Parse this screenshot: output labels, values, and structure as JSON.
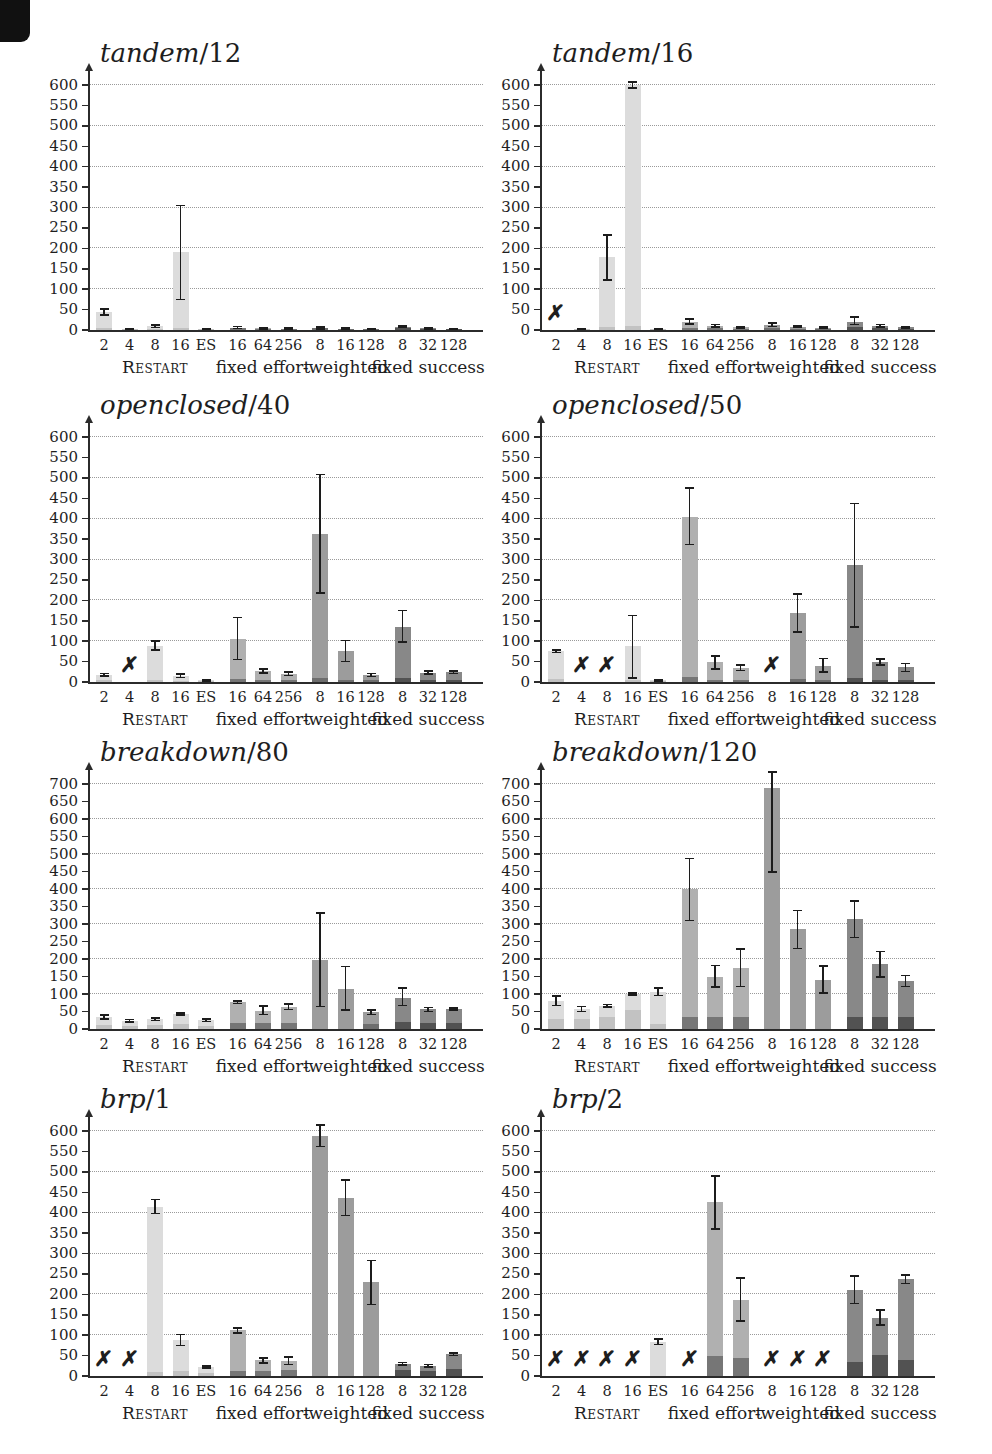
{
  "page": {
    "background": "#ffffff",
    "scan_artifact": "black-corner-mark"
  },
  "colors": {
    "restart_top": "#dcdcdc",
    "restart_base": "#c2c2c2",
    "fixed_effort_top": "#b0b0b0",
    "fixed_effort_base": "#767676",
    "weighted_top": "#9c9c9c",
    "weighted_base": "#6e6e6e",
    "fixed_success_top": "#888888",
    "fixed_success_base": "#525252",
    "error_bar": "#1c1c1c",
    "axis": "#2b2b2b",
    "grid": "#9a9a9a",
    "text": "#1e1e1e",
    "scan_mark": "#111111"
  },
  "chart_data": {
    "type": "bar",
    "failed_marker": "✗",
    "categories": [
      "2",
      "4",
      "8",
      "16",
      "ES",
      "16",
      "64",
      "256",
      "8",
      "16",
      "128",
      "8",
      "32",
      "128"
    ],
    "groups": [
      {
        "label": "Restart",
        "small_caps": true,
        "span": [
          0,
          4
        ]
      },
      {
        "label": "fixed effort",
        "small_caps": false,
        "span": [
          5,
          7
        ]
      },
      {
        "label": "-weighted",
        "small_caps": false,
        "span": [
          8,
          10
        ]
      },
      {
        "label": "fixed success",
        "small_caps": false,
        "span": [
          11,
          13
        ]
      }
    ],
    "charts": [
      {
        "title_name": "tandem",
        "title_suffix": "/12",
        "ymax": 600,
        "ytick_step": 50,
        "grid_step": 100,
        "values": [
          45,
          2,
          9,
          192,
          2,
          6,
          4,
          3,
          5,
          3,
          2,
          8,
          4,
          3
        ],
        "err_lo": [
          37,
          1,
          6,
          75,
          1,
          4,
          2,
          2,
          3,
          2,
          1,
          6,
          3,
          2
        ],
        "err_hi": [
          52,
          3,
          12,
          305,
          3,
          9,
          6,
          5,
          8,
          5,
          3,
          10,
          6,
          4
        ],
        "base": [
          4,
          1,
          3,
          6,
          1,
          4,
          3,
          2,
          4,
          2,
          1,
          6,
          3,
          2
        ],
        "failed_indices": []
      },
      {
        "title_name": "tandem",
        "title_suffix": "/16",
        "ymax": 600,
        "ytick_step": 50,
        "grid_step": 100,
        "values": [
          null,
          3,
          178,
          600,
          3,
          20,
          10,
          7,
          13,
          8,
          6,
          20,
          10,
          7
        ],
        "err_lo": [
          null,
          2,
          122,
          592,
          2,
          14,
          7,
          5,
          9,
          6,
          4,
          13,
          7,
          5
        ],
        "err_hi": [
          null,
          4,
          232,
          607,
          4,
          27,
          13,
          9,
          17,
          10,
          8,
          32,
          13,
          9
        ],
        "base": [
          0,
          2,
          8,
          10,
          2,
          6,
          4,
          3,
          5,
          3,
          2,
          8,
          4,
          3
        ],
        "failed_indices": [
          0
        ]
      },
      {
        "title_name": "openclosed",
        "title_suffix": "/40",
        "ymax": 600,
        "ytick_step": 50,
        "grid_step": 100,
        "values": [
          18,
          null,
          88,
          15,
          4,
          105,
          27,
          20,
          362,
          75,
          17,
          135,
          23,
          24
        ],
        "err_lo": [
          15,
          null,
          78,
          11,
          2,
          55,
          22,
          16,
          218,
          50,
          13,
          98,
          19,
          21
        ],
        "err_hi": [
          21,
          null,
          100,
          20,
          6,
          158,
          32,
          24,
          508,
          102,
          21,
          175,
          27,
          27
        ],
        "base": [
          4,
          0,
          6,
          3,
          1,
          8,
          5,
          4,
          10,
          6,
          4,
          9,
          5,
          5
        ],
        "failed_indices": [
          1
        ]
      },
      {
        "title_name": "openclosed",
        "title_suffix": "/50",
        "ymax": 600,
        "ytick_step": 50,
        "grid_step": 100,
        "values": [
          75,
          null,
          null,
          87,
          4,
          405,
          48,
          35,
          null,
          168,
          40,
          286,
          50,
          36
        ],
        "err_lo": [
          72,
          null,
          null,
          10,
          2,
          337,
          32,
          28,
          null,
          123,
          25,
          134,
          42,
          26
        ],
        "err_hi": [
          78,
          null,
          null,
          163,
          6,
          475,
          64,
          41,
          null,
          216,
          58,
          437,
          57,
          45
        ],
        "base": [
          8,
          0,
          0,
          6,
          1,
          12,
          6,
          5,
          0,
          8,
          5,
          10,
          6,
          5
        ],
        "failed_indices": [
          1,
          2,
          8
        ]
      },
      {
        "title_name": "breakdown",
        "title_suffix": "/80",
        "ymax": 700,
        "ytick_step": 50,
        "grid_step": 100,
        "values": [
          34,
          24,
          28,
          42,
          25,
          76,
          52,
          64,
          197,
          113,
          48,
          90,
          56,
          57
        ],
        "err_lo": [
          28,
          20,
          24,
          40,
          21,
          73,
          42,
          56,
          64,
          54,
          42,
          67,
          50,
          54
        ],
        "err_hi": [
          40,
          27,
          31,
          45,
          28,
          80,
          65,
          72,
          332,
          178,
          55,
          117,
          61,
          60
        ],
        "base": [
          12,
          10,
          11,
          14,
          10,
          18,
          16,
          17,
          0,
          0,
          14,
          20,
          16,
          16
        ],
        "failed_indices": []
      },
      {
        "title_name": "breakdown",
        "title_suffix": "/120",
        "ymax": 700,
        "ytick_step": 50,
        "grid_step": 100,
        "values": [
          80,
          57,
          67,
          100,
          106,
          400,
          150,
          173,
          690,
          285,
          140,
          315,
          185,
          138
        ],
        "err_lo": [
          67,
          50,
          63,
          97,
          96,
          310,
          120,
          122,
          448,
          230,
          103,
          262,
          148,
          122
        ],
        "err_hi": [
          95,
          64,
          70,
          103,
          117,
          487,
          182,
          228,
          735,
          338,
          180,
          365,
          222,
          153
        ],
        "base": [
          30,
          30,
          33,
          55,
          13,
          35,
          35,
          35,
          0,
          0,
          0,
          35,
          35,
          35
        ],
        "failed_indices": []
      },
      {
        "title_name": "brp",
        "title_suffix": "/1",
        "ymax": 600,
        "ytick_step": 50,
        "grid_step": 100,
        "values": [
          null,
          null,
          415,
          88,
          22,
          112,
          38,
          36,
          588,
          436,
          230,
          30,
          25,
          53
        ],
        "err_lo": [
          null,
          null,
          398,
          75,
          19,
          105,
          32,
          28,
          562,
          393,
          175,
          27,
          22,
          50
        ],
        "err_hi": [
          null,
          null,
          432,
          102,
          25,
          118,
          44,
          46,
          615,
          480,
          283,
          33,
          28,
          56
        ],
        "base": [
          0,
          0,
          10,
          13,
          8,
          12,
          12,
          14,
          0,
          0,
          0,
          14,
          12,
          16
        ],
        "failed_indices": [
          0,
          1
        ]
      },
      {
        "title_name": "brp",
        "title_suffix": "/2",
        "ymax": 600,
        "ytick_step": 50,
        "grid_step": 100,
        "values": [
          null,
          null,
          null,
          null,
          83,
          null,
          425,
          187,
          null,
          null,
          null,
          210,
          143,
          237
        ],
        "err_lo": [
          null,
          null,
          null,
          null,
          77,
          null,
          360,
          135,
          null,
          null,
          null,
          178,
          125,
          227
        ],
        "err_hi": [
          null,
          null,
          null,
          null,
          90,
          null,
          490,
          240,
          null,
          null,
          null,
          245,
          162,
          248
        ],
        "base": [
          0,
          0,
          0,
          0,
          0,
          0,
          48,
          45,
          0,
          0,
          0,
          35,
          52,
          40
        ],
        "failed_indices": [
          0,
          1,
          2,
          3,
          5,
          8,
          9,
          10
        ]
      }
    ]
  }
}
